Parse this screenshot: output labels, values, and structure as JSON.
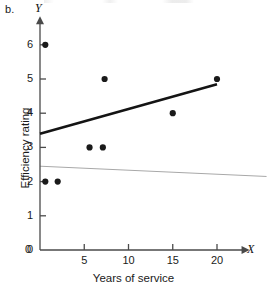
{
  "figure": {
    "panel_letter": "b.",
    "x_axis_name": "X",
    "y_axis_name": "Y",
    "x_axis_title": "Years of service",
    "y_axis_title": "Efficiency rating"
  },
  "colors": {
    "point": "#1a1a1a",
    "axis": "#4a4a4a",
    "fit_line": "#141414",
    "reference_line": "#a8a8a8",
    "text": "#1a1a1a",
    "background": "#ffffff"
  },
  "chart_data": {
    "type": "scatter",
    "title": "",
    "subtitle": "",
    "xlabel": "Years of service",
    "ylabel": "Efficiency rating",
    "xlim": [
      0,
      23
    ],
    "ylim": [
      0,
      6.6
    ],
    "grid": false,
    "legend": "none",
    "x_ticks": [
      0,
      5,
      10,
      15,
      20
    ],
    "x_tick_labels": [
      "0",
      "5",
      "10",
      "15",
      "20"
    ],
    "y_ticks": [
      0,
      1,
      2,
      3,
      4,
      5,
      6
    ],
    "y_tick_labels": [
      "0",
      "1",
      "2",
      "3",
      "4",
      "5",
      "6"
    ],
    "points": [
      {
        "x": 0.6,
        "y": 6
      },
      {
        "x": 0.6,
        "y": 2
      },
      {
        "x": 2.0,
        "y": 2
      },
      {
        "x": 5.6,
        "y": 3
      },
      {
        "x": 7.1,
        "y": 3
      },
      {
        "x": 7.3,
        "y": 5
      },
      {
        "x": 15.0,
        "y": 4
      },
      {
        "x": 20.0,
        "y": 5
      }
    ],
    "series": [
      {
        "name": "observations",
        "x": [
          0.6,
          0.6,
          2.0,
          5.6,
          7.1,
          7.3,
          15.0,
          20.0
        ],
        "values": [
          6,
          2,
          2,
          3,
          3,
          5,
          4,
          5
        ]
      }
    ],
    "lines": [
      {
        "name": "fit-line",
        "style": "thick-black",
        "x_start": 0.0,
        "y_start": 3.4,
        "x_end": 20.0,
        "y_end": 4.85
      },
      {
        "name": "reference-line",
        "style": "thin-gray",
        "x_start": 0.0,
        "y_start": 2.45,
        "x_end": 25.6,
        "y_end": 2.15
      }
    ]
  }
}
